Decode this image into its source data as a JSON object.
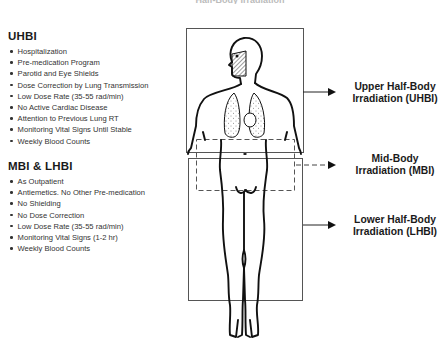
{
  "header": {
    "title_fragment": "Half-Body Irradiation"
  },
  "sections": [
    {
      "title": "UHBI",
      "items": [
        "Hospitalization",
        "Pre-medication Program",
        "Parotid and Eye Shields",
        "Dose Correction by Lung Transmission",
        "Low Dose Rate (35-55 rad/min)",
        "No Active Cardiac Disease",
        "Attention to Previous Lung RT",
        "Monitoring Vital Signs Until Stable",
        "Weekly Blood Counts"
      ]
    },
    {
      "title": "MBI & LHBI",
      "items": [
        "As Outpatient",
        "Antiemetics. No Other Pre-medication",
        "No Shielding",
        "No Dose Correction",
        "Low Dose Rate (35-55 rad/min)",
        "Monitoring Vital Signs (1-2 hr)",
        "Weekly Blood Counts"
      ]
    }
  ],
  "fields": [
    {
      "line1": "Upper Half-Body",
      "line2": "Irradiation (UHBI)",
      "arrow_style": "solid"
    },
    {
      "line1": "Mid-Body",
      "line2": "Irradiation (MBI)",
      "arrow_style": "dashed"
    },
    {
      "line1": "Lower Half-Body",
      "line2": "Irradiation (LHBI)",
      "arrow_style": "solid"
    }
  ],
  "icons": {
    "bullet": "bullet-dot-icon",
    "arrow": "arrow-right-icon"
  },
  "colors": {
    "ink": "#1a1a1a",
    "box_line": "#555555",
    "background": "#ffffff"
  }
}
